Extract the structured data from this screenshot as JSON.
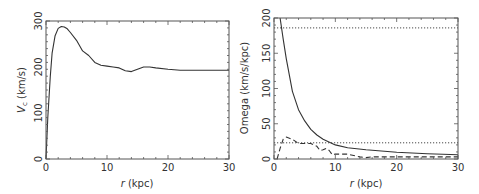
{
  "chart_data": [
    {
      "type": "line",
      "panel": "left",
      "title": "",
      "xlabel": "r (kpc)",
      "xlabel_italic": "r",
      "xlabel_rest": " (kpc)",
      "ylabel": "V_c (km/s)",
      "ylabel_main": "V",
      "ylabel_sub": "c",
      "ylabel_rest": " (km/s)",
      "xlim": [
        0,
        30
      ],
      "ylim": [
        0,
        300
      ],
      "xticks": [
        0,
        10,
        20,
        30
      ],
      "yticks": [
        0,
        100,
        200,
        300
      ],
      "grid": false,
      "series": [
        {
          "name": "rotation curve",
          "style": "solid",
          "x": [
            0,
            0.3,
            0.7,
            1.0,
            1.5,
            2.0,
            2.5,
            3.0,
            3.5,
            4.0,
            5.0,
            6.0,
            7.0,
            8.0,
            9.0,
            10.0,
            11.0,
            12.0,
            13.0,
            14.0,
            15.0,
            16.0,
            17.0,
            18.0,
            20.0,
            22.0,
            25.0,
            30.0
          ],
          "y": [
            0,
            90,
            180,
            230,
            268,
            284,
            288,
            287,
            283,
            275,
            258,
            235,
            225,
            210,
            204,
            202,
            200,
            198,
            192,
            190,
            195,
            200,
            200,
            198,
            195,
            193,
            193,
            193
          ]
        }
      ]
    },
    {
      "type": "line",
      "panel": "right",
      "title": "",
      "xlabel": "r (kpc)",
      "xlabel_italic": "r",
      "xlabel_rest": " (kpc)",
      "ylabel": "Omega (km/s/kpc)",
      "xlim": [
        0,
        30
      ],
      "ylim": [
        0,
        200
      ],
      "xticks": [
        0,
        10,
        20,
        30
      ],
      "yticks": [
        0,
        50,
        100,
        150,
        200
      ],
      "grid": false,
      "series": [
        {
          "name": "Omega",
          "style": "solid",
          "x": [
            1.0,
            1.5,
            2.0,
            3.0,
            4.0,
            5.0,
            6.0,
            7.0,
            8.0,
            10.0,
            12.0,
            15.0,
            20.0,
            25.0,
            30.0
          ],
          "y": [
            200,
            170,
            142,
            96,
            70,
            54,
            42,
            34,
            28,
            20,
            16,
            13,
            9.5,
            7.5,
            6
          ]
        },
        {
          "name": "pattern speed (upper)",
          "style": "dotted",
          "x": [
            0,
            30
          ],
          "y": [
            186,
            186
          ]
        },
        {
          "name": "pattern speed (lower)",
          "style": "dotted",
          "x": [
            0,
            30
          ],
          "y": [
            23,
            23
          ]
        },
        {
          "name": "secondary curve",
          "style": "dashed",
          "x": [
            0.5,
            1.0,
            1.5,
            2.0,
            3.0,
            4.0,
            5.0,
            6.0,
            7.0,
            7.5,
            8.0,
            8.5,
            9.0,
            9.5,
            10.0,
            12.0,
            13.0,
            14.0,
            15.0,
            16.0,
            18.0,
            20.0,
            25.0,
            30.0
          ],
          "y": [
            0,
            15,
            28,
            31,
            28,
            22,
            22,
            22,
            18,
            12,
            13,
            15,
            12,
            6,
            7,
            7,
            5,
            3,
            2,
            3,
            3,
            3,
            3,
            3
          ]
        }
      ]
    }
  ]
}
